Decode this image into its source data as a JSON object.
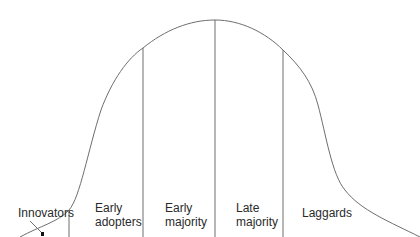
{
  "diagram": {
    "curve_color": "#6e6e6e",
    "line_color": "#6e6e6e",
    "text_color": "#2a2a2a",
    "segments": [
      {
        "id": "innovators",
        "line1": "Innovators",
        "line2": ""
      },
      {
        "id": "early-adopters",
        "line1": "Early",
        "line2": "adopters"
      },
      {
        "id": "early-majority",
        "line1": "Early",
        "line2": "majority"
      },
      {
        "id": "late-majority",
        "line1": "Late",
        "line2": "majority"
      },
      {
        "id": "laggards",
        "line1": "Laggards",
        "line2": ""
      }
    ]
  }
}
